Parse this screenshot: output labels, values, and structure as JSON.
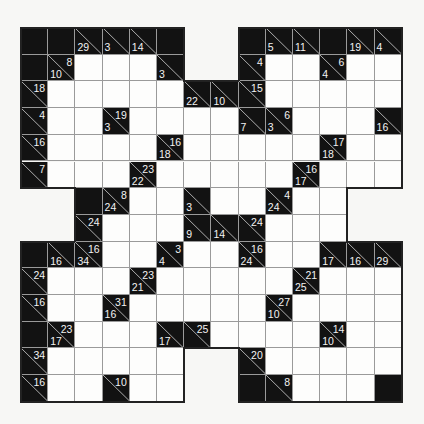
{
  "puzzle": {
    "type": "kakuro",
    "rows": 14,
    "cols": 14,
    "legend": {
      "X": "black",
      "W": "white-entry",
      "O": "outside"
    },
    "grid": [
      [
        "X",
        "X",
        {
          "d": 29
        },
        {
          "d": 3
        },
        {
          "d": 14
        },
        "X",
        "O",
        "O",
        "X",
        {
          "d": 5
        },
        {
          "d": 11
        },
        "X",
        {
          "d": 19
        },
        {
          "d": 4
        }
      ],
      [
        "X",
        {
          "r": 8,
          "d": 10
        },
        "W",
        "W",
        "W",
        {
          "d": 3
        },
        "O",
        "O",
        {
          "r": 4
        },
        "W",
        "W",
        {
          "r": 6,
          "d": 4
        },
        "W",
        "W"
      ],
      [
        {
          "r": 18
        },
        "W",
        "W",
        "W",
        "W",
        "W",
        {
          "d": 22
        },
        {
          "d": 10
        },
        {
          "r": 15
        },
        "W",
        "W",
        "W",
        "W",
        "W"
      ],
      [
        {
          "r": 4
        },
        "W",
        "W",
        {
          "r": 19,
          "d": 3
        },
        "W",
        "W",
        "W",
        "W",
        {
          "d": 7
        },
        {
          "r": 6,
          "d": 3
        },
        "W",
        "W",
        "W",
        {
          "d": 16
        }
      ],
      [
        {
          "r": 16
        },
        "W",
        "W",
        "W",
        "W",
        {
          "r": 16,
          "d": 18
        },
        "W",
        "W",
        "W",
        "W",
        "W",
        {
          "r": 17,
          "d": 18
        },
        "W",
        "W"
      ],
      [
        {
          "r": 7
        },
        "W",
        "W",
        "W",
        {
          "r": 23,
          "d": 22
        },
        "W",
        "W",
        "W",
        "W",
        "W",
        {
          "r": 16,
          "d": 17
        },
        "W",
        "W",
        "W"
      ],
      [
        "O",
        "O",
        "X",
        {
          "r": 8,
          "d": 24
        },
        "W",
        "W",
        {
          "d": 3
        },
        "W",
        "W",
        {
          "r": 4,
          "d": 24
        },
        "W",
        "W",
        "O",
        "O"
      ],
      [
        "O",
        "O",
        {
          "r": 24
        },
        "W",
        "W",
        "W",
        {
          "d": 9
        },
        {
          "d": 14
        },
        {
          "r": 24
        },
        "W",
        "W",
        "W",
        "O",
        "O"
      ],
      [
        "X",
        {
          "d": 16
        },
        {
          "r": 16,
          "d": 34
        },
        "W",
        "W",
        {
          "r": 3,
          "d": 4
        },
        "W",
        "W",
        {
          "r": 16,
          "d": 24
        },
        "W",
        "W",
        {
          "d": 17
        },
        {
          "d": 16
        },
        {
          "d": 29
        }
      ],
      [
        {
          "r": 24
        },
        "W",
        "W",
        "W",
        {
          "r": 23,
          "d": 21
        },
        "W",
        "W",
        "W",
        "W",
        "W",
        {
          "r": 21,
          "d": 25
        },
        "W",
        "W",
        "W"
      ],
      [
        {
          "r": 16
        },
        "W",
        "W",
        {
          "r": 31,
          "d": 16
        },
        "W",
        "W",
        "W",
        "W",
        "W",
        {
          "r": 27,
          "d": 10
        },
        "W",
        "W",
        "W",
        "W"
      ],
      [
        "X",
        {
          "r": 23,
          "d": 17
        },
        "W",
        "W",
        "W",
        {
          "d": 17
        },
        {
          "r": 25
        },
        "W",
        "W",
        "W",
        "W",
        {
          "r": 14,
          "d": 10
        },
        "W",
        "W"
      ],
      [
        {
          "r": 34
        },
        "W",
        "W",
        "W",
        "W",
        "W",
        "O",
        "O",
        {
          "r": 20
        },
        "W",
        "W",
        "W",
        "W",
        "W"
      ],
      [
        {
          "r": 16
        },
        "W",
        "W",
        {
          "r": 10
        },
        "W",
        "W",
        "O",
        "O",
        "X",
        {
          "r": 8
        },
        "W",
        "W",
        "W",
        "X"
      ]
    ]
  }
}
